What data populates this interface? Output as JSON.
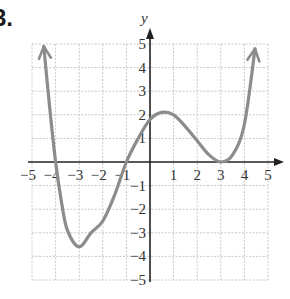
{
  "problem": {
    "number": "3."
  },
  "chart_data": {
    "type": "line",
    "title": "",
    "xlabel": "",
    "ylabel": "y",
    "xlim": [
      -5,
      5
    ],
    "ylim": [
      -5,
      5
    ],
    "grid": true,
    "x_tick_labels": [
      "−5",
      "−4",
      "−3",
      "−2",
      "−1",
      "1",
      "2",
      "3",
      "4",
      "5"
    ],
    "y_tick_labels": [
      "5",
      "4",
      "3",
      "2",
      "1",
      "−1",
      "−2",
      "−3",
      "−4",
      "−5"
    ],
    "series": [
      {
        "name": "f(x)",
        "description": "Quartic polynomial with zeros at x=-4, x=-1 and a double zero (touching) at x=3; arrows at both ends pointing up",
        "x_intercepts": [
          -4,
          -1,
          3
        ],
        "y_intercept": 1.8,
        "local_min": [
          -3,
          -3.6
        ],
        "local_max": [
          0.5,
          2.1
        ],
        "end_behavior": "both ends up (arrows)",
        "points": [
          [
            -4.5,
            4.9
          ],
          [
            -4.25,
            2.3
          ],
          [
            -4,
            0
          ],
          [
            -3.75,
            -1.7
          ],
          [
            -3.5,
            -2.9
          ],
          [
            -3,
            -3.6
          ],
          [
            -2.5,
            -3.0
          ],
          [
            -2,
            -2.5
          ],
          [
            -1.5,
            -1.4
          ],
          [
            -1,
            0
          ],
          [
            -0.5,
            1.0
          ],
          [
            0,
            1.8
          ],
          [
            0.5,
            2.1
          ],
          [
            1,
            2.0
          ],
          [
            1.5,
            1.5
          ],
          [
            2,
            0.9
          ],
          [
            2.5,
            0.3
          ],
          [
            3,
            0
          ],
          [
            3.5,
            0.3
          ],
          [
            4,
            1.6
          ],
          [
            4.45,
            4.8
          ]
        ]
      }
    ],
    "colors": {
      "curve": "#8c8c8c",
      "axis": "#222222",
      "grid": "#c8c8c8"
    }
  },
  "axes": {
    "y_name": "y"
  }
}
